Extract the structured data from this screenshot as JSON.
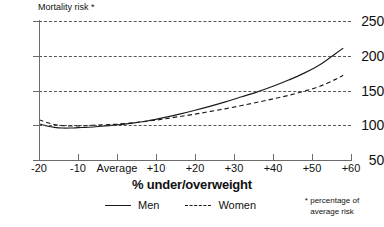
{
  "chart_data": {
    "type": "line",
    "title": "",
    "ylabel": "Mortality risk *",
    "xlabel": "% under/overweight",
    "xlim": [
      -20,
      60
    ],
    "ylim": [
      50,
      250
    ],
    "grid": true,
    "grid_style": "dashed-horizontal",
    "legend_position": "bottom-center",
    "x_tick_values": [
      -20,
      -10,
      0,
      10,
      20,
      30,
      40,
      50,
      60
    ],
    "x_tick_labels": [
      "-20",
      "-10",
      "Average",
      "+10",
      "+20",
      "+30",
      "+40",
      "+50",
      "+60"
    ],
    "y_tick_values": [
      50,
      100,
      150,
      200,
      250
    ],
    "y_tick_labels": [
      "50",
      "100",
      "150",
      "200",
      "250"
    ],
    "annotations": [
      "* percentage of average risk"
    ],
    "x": [
      -20,
      -18,
      -16,
      -14,
      -12,
      -10,
      -8,
      -6,
      -4,
      -2,
      0,
      4,
      8,
      12,
      16,
      20,
      24,
      28,
      32,
      36,
      40,
      44,
      48,
      52,
      56,
      58
    ],
    "series": [
      {
        "name": "Men",
        "line_style": "solid",
        "color": "#1a1a1a",
        "values": [
          102,
          99,
          97,
          96,
          96,
          96.5,
          97,
          97.5,
          98.5,
          99.5,
          100.5,
          103,
          106.5,
          111,
          116,
          121.5,
          127.5,
          134,
          141,
          148,
          156,
          165,
          175,
          187,
          203,
          211
        ]
      },
      {
        "name": "Women",
        "line_style": "dashed",
        "color": "#1a1a1a",
        "values": [
          108,
          104,
          101,
          99.5,
          99,
          99,
          99.5,
          100,
          100.5,
          101,
          101.5,
          103.5,
          106,
          109,
          112.5,
          116,
          120,
          124,
          128.5,
          133,
          138,
          143,
          149,
          156,
          166,
          172
        ]
      }
    ]
  },
  "axis": {
    "y_title": "Mortality risk *",
    "x_title": "% under/overweight"
  },
  "legend": {
    "entries": [
      {
        "label": "Men",
        "style": "solid"
      },
      {
        "label": "Women",
        "style": "dashed"
      }
    ]
  },
  "footnote": {
    "line1": "* percentage of",
    "line2": "average risk"
  }
}
